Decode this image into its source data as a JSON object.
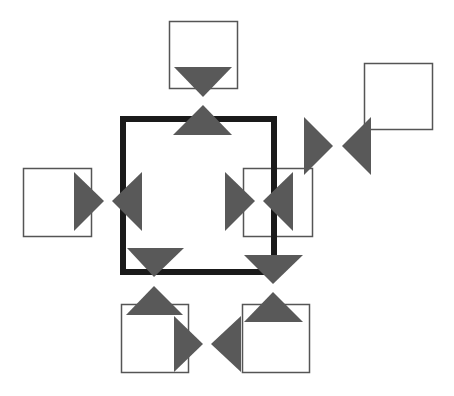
{
  "canvas": {
    "width": 454,
    "height": 396,
    "background": "#ffffff"
  },
  "colors": {
    "main_border": "#1a1a1a",
    "box_border": "#555555",
    "triangle": "#595959"
  },
  "main_square": {
    "x": 120,
    "y": 116,
    "w": 157,
    "h": 159,
    "stroke": 6
  },
  "boxes": [
    {
      "id": "top",
      "x": 169,
      "y": 21,
      "w": 68,
      "h": 67
    },
    {
      "id": "top-right",
      "x": 364,
      "y": 63,
      "w": 68,
      "h": 66
    },
    {
      "id": "left",
      "x": 23,
      "y": 168,
      "w": 68,
      "h": 68
    },
    {
      "id": "right",
      "x": 243,
      "y": 168,
      "w": 69,
      "h": 68
    },
    {
      "id": "bottom-left",
      "x": 121,
      "y": 304,
      "w": 67,
      "h": 68
    },
    {
      "id": "bottom-right",
      "x": 242,
      "y": 304,
      "w": 67,
      "h": 68
    }
  ],
  "triangles": [
    {
      "id": "top-down",
      "points": "174,67 232,67 203,97"
    },
    {
      "id": "top-up",
      "points": "203,105 232,135 173,135"
    },
    {
      "id": "tr-right",
      "points": "304,117 333,146 304,175"
    },
    {
      "id": "tr-left",
      "points": "371,117 342,146 371,175"
    },
    {
      "id": "left-right",
      "points": "74,172 104,201 74,231"
    },
    {
      "id": "left-left",
      "points": "142,172 112,201 142,231"
    },
    {
      "id": "mid-right",
      "points": "225,172 255,201 225,231"
    },
    {
      "id": "mid-left",
      "points": "293,172 263,201 293,231"
    },
    {
      "id": "bl-down",
      "points": "127,248 184,248 154,277"
    },
    {
      "id": "bl-up",
      "points": "154,286 183,315 126,315"
    },
    {
      "id": "br-down",
      "points": "244,255 303,255 273,284"
    },
    {
      "id": "br-up",
      "points": "273,292 303,322 244,322"
    },
    {
      "id": "bottom-right-pointing",
      "points": "174,316 203,344 174,372"
    },
    {
      "id": "bottom-left-pointing",
      "points": "241,316 211,344 241,372"
    }
  ]
}
